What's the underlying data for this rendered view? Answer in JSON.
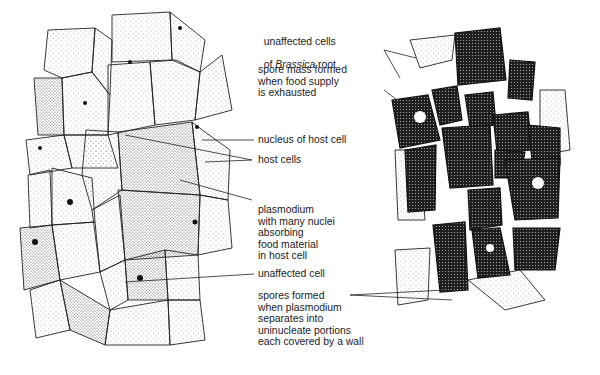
{
  "diagram": {
    "left_panel": "early infection: plasmodium absorbing food in host cells",
    "right_panel": "later stage: spore masses formed in host cells"
  },
  "labels": [
    {
      "id": "unaffected-cells",
      "lines": [
        "unaffected cells",
        "of Brassica root"
      ],
      "italic_word": "Brassica"
    },
    {
      "id": "spore-mass",
      "lines": [
        "spore mass formed",
        "when food supply",
        "is exhausted"
      ]
    },
    {
      "id": "nucleus-host",
      "lines": [
        "nucleus of host cell"
      ]
    },
    {
      "id": "host-cells",
      "lines": [
        "host cells"
      ]
    },
    {
      "id": "plasmodium",
      "lines": [
        "plasmodium",
        "with many nuclei",
        "absorbing",
        "food material",
        "in host cell"
      ]
    },
    {
      "id": "unaffected-cell",
      "lines": [
        "unaffected cell"
      ]
    },
    {
      "id": "spores-formed",
      "lines": [
        "spores formed",
        "when plasmodium",
        "separates into",
        "uninucleate portions",
        "each covered by a wall"
      ]
    }
  ],
  "label_text": {
    "unaffected_cells_1": "unaffected cells",
    "unaffected_cells_2a": "of ",
    "unaffected_cells_2b": "Brassica",
    "unaffected_cells_2c": " root",
    "spore_mass": "spore mass formed\nwhen food supply\nis exhausted",
    "nucleus_host": "nucleus of host cell",
    "host_cells": "host cells",
    "plasmodium": "plasmodium\nwith many nuclei\nabsorbing\nfood material\nin host cell",
    "unaffected_cell": "unaffected cell",
    "spores_formed": "spores formed\nwhen plasmodium\nseparates into\nuninucleate portions\neach covered by a wall"
  },
  "colors": {
    "ink": "#1a1a1a",
    "background": "#ffffff",
    "spore": "#2a2a2a"
  }
}
